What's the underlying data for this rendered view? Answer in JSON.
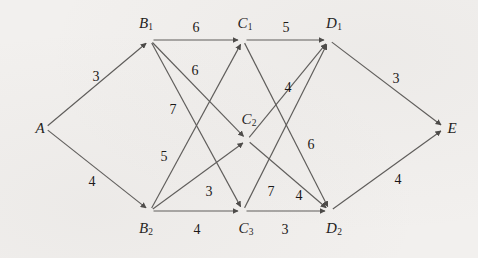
{
  "diagram": {
    "type": "directed-graph",
    "background_color": "#f2f0ee",
    "edge_color": "#5d5b59",
    "label_color": "#1d1b1a",
    "width": 478,
    "height": 258
  },
  "nodes": [
    {
      "id": "A",
      "base": "A",
      "sub": "",
      "x": 45,
      "y": 128,
      "label_x": 40,
      "label_y": 128,
      "layer": 0
    },
    {
      "id": "B1",
      "base": "B",
      "sub": "1",
      "x": 150,
      "y": 40,
      "label_x": 146,
      "label_y": 24,
      "layer": 1
    },
    {
      "id": "B2",
      "base": "B",
      "sub": "2",
      "x": 150,
      "y": 211,
      "label_x": 146,
      "label_y": 229,
      "layer": 1
    },
    {
      "id": "C1",
      "base": "C",
      "sub": "1",
      "x": 243,
      "y": 40,
      "label_x": 245,
      "label_y": 24,
      "layer": 2
    },
    {
      "id": "C2",
      "base": "C",
      "sub": "2",
      "x": 247,
      "y": 140,
      "label_x": 249,
      "label_y": 120,
      "layer": 2
    },
    {
      "id": "C3",
      "base": "C",
      "sub": "3",
      "x": 243,
      "y": 211,
      "label_x": 246,
      "label_y": 229,
      "layer": 2
    },
    {
      "id": "D1",
      "base": "D",
      "sub": "1",
      "x": 329,
      "y": 40,
      "label_x": 334,
      "label_y": 24,
      "layer": 3
    },
    {
      "id": "D2",
      "base": "D",
      "sub": "2",
      "x": 330,
      "y": 211,
      "label_x": 334,
      "label_y": 229,
      "layer": 3
    },
    {
      "id": "E",
      "base": "E",
      "sub": "",
      "x": 445,
      "y": 128,
      "label_x": 452,
      "label_y": 128,
      "layer": 4
    }
  ],
  "edges": [
    {
      "from": "A",
      "to": "B1",
      "weight": "3",
      "label_x": 96,
      "label_y": 77
    },
    {
      "from": "A",
      "to": "B2",
      "weight": "4",
      "label_x": 92,
      "label_y": 182
    },
    {
      "from": "B1",
      "to": "C1",
      "weight": "6",
      "label_x": 196,
      "label_y": 28
    },
    {
      "from": "B1",
      "to": "C2",
      "weight": "6",
      "label_x": 195,
      "label_y": 71
    },
    {
      "from": "B1",
      "to": "C3",
      "weight": "7",
      "label_x": 173,
      "label_y": 110
    },
    {
      "from": "B2",
      "to": "C1",
      "weight": "5",
      "label_x": 164,
      "label_y": 157
    },
    {
      "from": "B2",
      "to": "C2",
      "weight": "3",
      "label_x": 209,
      "label_y": 192
    },
    {
      "from": "B2",
      "to": "C3",
      "weight": "4",
      "label_x": 197,
      "label_y": 230
    },
    {
      "from": "C1",
      "to": "D1",
      "weight": "5",
      "label_x": 286,
      "label_y": 28
    },
    {
      "from": "C1",
      "to": "D2",
      "weight": "4",
      "label_x": 288,
      "label_y": 88
    },
    {
      "from": "C2",
      "to": "D1",
      "weight": "6",
      "label_x": 311,
      "label_y": 145
    },
    {
      "from": "C3",
      "to": "D1",
      "weight": "7",
      "label_x": 271,
      "label_y": 192
    },
    {
      "from": "C3",
      "to": "D2",
      "weight": "3",
      "label_x": 285,
      "label_y": 230
    },
    {
      "from": "C2",
      "to": "D2",
      "weight": "4",
      "label_x": 299,
      "label_y": 196
    },
    {
      "from": "D1",
      "to": "E",
      "weight": "3",
      "label_x": 396,
      "label_y": 79
    },
    {
      "from": "D2",
      "to": "E",
      "weight": "4",
      "label_x": 398,
      "label_y": 180
    }
  ]
}
